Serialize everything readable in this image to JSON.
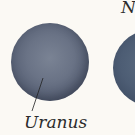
{
  "planets": [
    {
      "name": "Uranus",
      "label": "Uranus",
      "color": "#6a7386"
    },
    {
      "name": "Neptune",
      "label": "N",
      "color": "#4d5d74"
    }
  ]
}
